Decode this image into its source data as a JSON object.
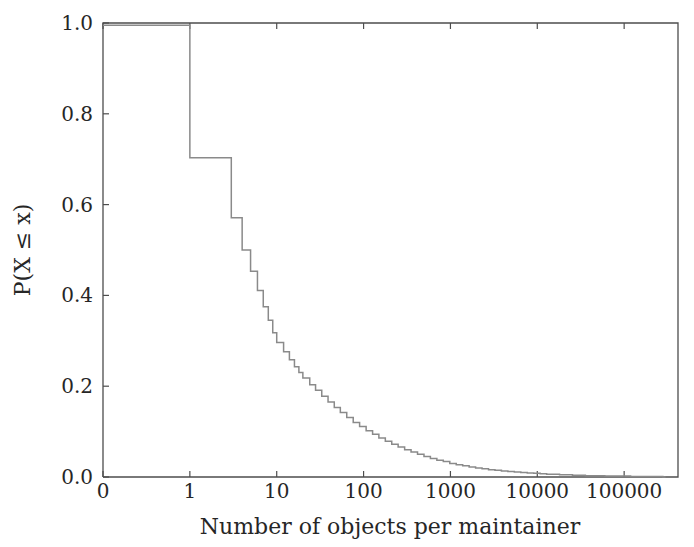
{
  "chart_data": {
    "type": "line",
    "title": "",
    "subtitle": "",
    "xlabel": "Number of objects per maintainer",
    "ylabel": "P(X ≤ x)",
    "grid": false,
    "legend": null,
    "legend_position": "none",
    "line_color": "#8a8a8a",
    "axis_color": "#4d4d4d",
    "text_color": "#262626",
    "background_color": "#ffffff",
    "xscale": "symlog",
    "yscale": "linear",
    "xlim": [
      0,
      300000
    ],
    "ylim": [
      0.0,
      1.0
    ],
    "x_tick_labels": [
      "0",
      "1",
      "10",
      "100",
      "1000",
      "10000",
      "100000"
    ],
    "x_tick_values": [
      0,
      1,
      10,
      100,
      1000,
      10000,
      100000
    ],
    "y_tick_labels": [
      "0.0",
      "0.2",
      "0.4",
      "0.6",
      "0.8",
      "1.0"
    ],
    "y_tick_values": [
      0.0,
      0.2,
      0.4,
      0.6,
      0.8,
      1.0
    ],
    "series": [
      {
        "name": "Empirical CDF of objects per maintainer",
        "step_mode": "post",
        "x": [
          0,
          1,
          2,
          3,
          4,
          5,
          6,
          7,
          8,
          9,
          10,
          12,
          14,
          16,
          18,
          20,
          24,
          28,
          33,
          39,
          46,
          54,
          64,
          76,
          90,
          107,
          127,
          150,
          178,
          211,
          250,
          297,
          352,
          418,
          496,
          588,
          698,
          828,
          983,
          1166,
          1384,
          1642,
          1949,
          2313,
          2745,
          3257,
          3865,
          4587,
          5444,
          6460,
          7667,
          9098,
          10797,
          12814,
          15206,
          18045,
          21414,
          25412,
          30156,
          35785,
          42465,
          50393,
          59802,
          70965,
          84212,
          99932,
          118589,
          140730,
          167004,
          198182,
          235185,
          279100,
          300000
        ],
        "y": [
          0.995,
          0.703,
          0.703,
          0.571,
          0.5,
          0.453,
          0.411,
          0.375,
          0.345,
          0.318,
          0.296,
          0.276,
          0.258,
          0.243,
          0.23,
          0.218,
          0.203,
          0.191,
          0.178,
          0.165,
          0.153,
          0.142,
          0.131,
          0.12,
          0.111,
          0.102,
          0.094,
          0.086,
          0.079,
          0.072,
          0.066,
          0.06,
          0.055,
          0.05,
          0.045,
          0.041,
          0.037,
          0.034,
          0.03,
          0.027,
          0.025,
          0.022,
          0.02,
          0.018,
          0.016,
          0.015,
          0.013,
          0.012,
          0.011,
          0.01,
          0.009,
          0.008,
          0.007,
          0.006,
          0.006,
          0.005,
          0.005,
          0.004,
          0.004,
          0.003,
          0.003,
          0.003,
          0.002,
          0.002,
          0.002,
          0.002,
          0.001,
          0.001,
          0.001,
          0.001,
          0.001,
          0.0,
          0.0
        ]
      }
    ]
  },
  "plot_geometry": {
    "left": 103,
    "right": 678,
    "top": 23,
    "bottom": 477
  }
}
